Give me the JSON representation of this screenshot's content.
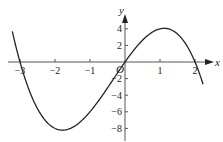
{
  "chart_data": {
    "type": "line",
    "title": "",
    "function": "y = -x^3 - x^2 + 6x",
    "xlabel": "x",
    "ylabel": "y",
    "origin_label": "O",
    "x_ticks": [
      -3,
      -2,
      -1,
      1,
      2
    ],
    "x_tick_labels": [
      "-3",
      "-2",
      "-1",
      "1",
      "2"
    ],
    "y_ticks": [
      4,
      2,
      -2,
      -4,
      -6,
      -8
    ],
    "y_tick_labels": [
      "4",
      "2",
      "-2",
      "-4",
      "-6",
      "-8"
    ],
    "xlim": [
      -3.3,
      2.5
    ],
    "ylim": [
      -8.5,
      5.5
    ],
    "grid": false,
    "legend": "none",
    "key_points": [
      {
        "x": -3,
        "y": 0
      },
      {
        "x": 0,
        "y": 0
      },
      {
        "x": 2,
        "y": 0
      },
      {
        "x": -1.79,
        "y": -8.21
      },
      {
        "x": 1.12,
        "y": 4.06
      }
    ],
    "x": [
      -3.22,
      -3.0,
      -2.75,
      -2.5,
      -2.25,
      -2.0,
      -1.75,
      -1.5,
      -1.25,
      -1.0,
      -0.75,
      -0.5,
      -0.25,
      0.0,
      0.25,
      0.5,
      0.75,
      1.0,
      1.25,
      1.5,
      1.75,
      2.0,
      2.23
    ],
    "series": [
      {
        "name": "f(x)",
        "values": [
          3.56,
          0.0,
          -3.05,
          -5.63,
          -7.45,
          -8.0,
          -7.7,
          -6.38,
          -6.05,
          -6.0,
          -4.64,
          -3.13,
          -1.55,
          0.0,
          1.42,
          2.63,
          3.52,
          4.0,
          3.98,
          3.38,
          2.08,
          0.0,
          -2.66
        ]
      }
    ]
  }
}
